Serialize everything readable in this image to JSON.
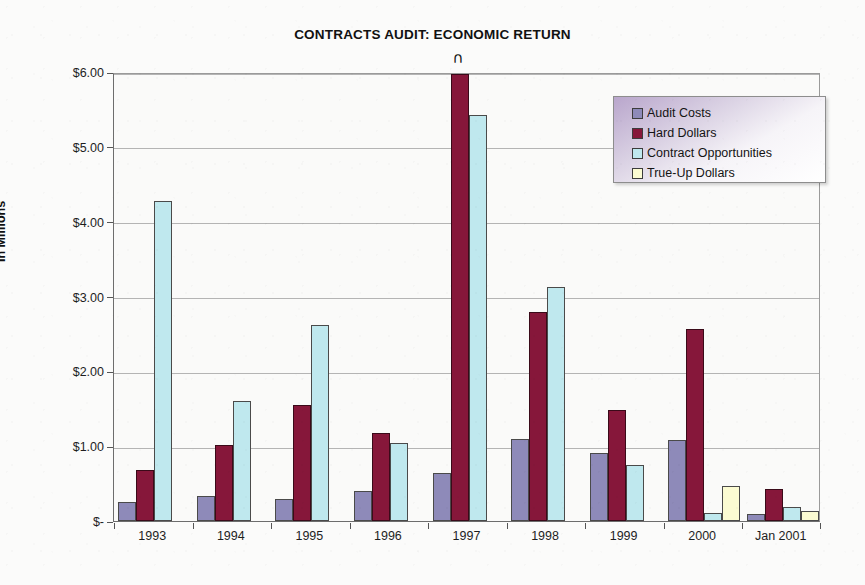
{
  "chart_data": {
    "type": "bar",
    "title": "CONTRACTS AUDIT: ECONOMIC RETURN",
    "xlabel": "",
    "ylabel": "In Millions",
    "categories": [
      "1993",
      "1994",
      "1995",
      "1996",
      "1997",
      "1998",
      "1999",
      "2000",
      "Jan 2001"
    ],
    "ylim": [
      0,
      6
    ],
    "ytick_labels": [
      "$-",
      "$1.00",
      "$2.00",
      "$3.00",
      "$4.00",
      "$5.00",
      "$6.00"
    ],
    "ytick_values": [
      0,
      1,
      2,
      3,
      4,
      5,
      6
    ],
    "grid": true,
    "legend_position": "top-right",
    "series": [
      {
        "name": "Audit Costs",
        "color": "#8e8ab9",
        "values": [
          0.25,
          0.33,
          0.29,
          0.4,
          0.64,
          1.09,
          0.91,
          1.08,
          0.1
        ]
      },
      {
        "name": "Hard Dollars",
        "color": "#86173a",
        "values": [
          0.68,
          1.01,
          1.55,
          1.18,
          5.98,
          2.79,
          1.49,
          2.57,
          0.43
        ]
      },
      {
        "name": "Contract Opportunities",
        "color": "#bfe8ee",
        "values": [
          4.27,
          1.6,
          2.62,
          1.04,
          5.42,
          3.13,
          0.75,
          0.11,
          0.19
        ]
      },
      {
        "name": "True-Up Dollars",
        "color": "#fbfbd2",
        "values": [
          0,
          0,
          0,
          0,
          0,
          0,
          0,
          0.47,
          0.13
        ]
      }
    ],
    "annotations": [
      {
        "text": "∩",
        "category": "1997",
        "series": "Hard Dollars",
        "note": "overflow-arch-marker-above-bar"
      }
    ]
  }
}
